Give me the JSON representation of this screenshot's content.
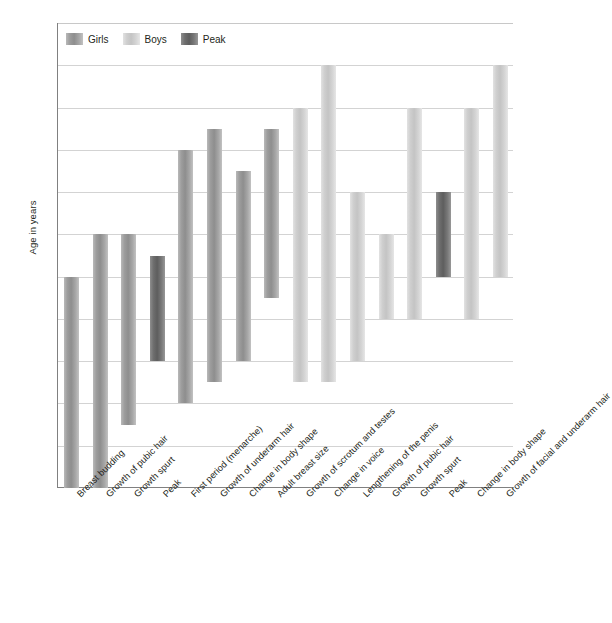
{
  "chart_data": {
    "type": "bar",
    "orientation": "vertical-range",
    "title": "",
    "xlabel": "",
    "ylabel": "Age in years",
    "ylim": [
      8,
      19
    ],
    "yticks": [
      8,
      9,
      10,
      11,
      12,
      13,
      14,
      15,
      16,
      17,
      18,
      19
    ],
    "grid": true,
    "legend_position": "top-left-inside",
    "legend": [
      {
        "name": "Girls",
        "color": "#9d9d9d"
      },
      {
        "name": "Boys",
        "color": "#cfcfcf"
      },
      {
        "name": "Peak",
        "color": "#6f6f6f"
      }
    ],
    "categories": [
      "Breast budding",
      "Growth of pubic hair",
      "Growth spurt",
      "Peak",
      "First period (menarche)",
      "Growth of underarm hair",
      "Change in body shape",
      "Adult breast size",
      "Growth of scrotum and testes",
      "Change in voice",
      "Lengthening of the penis",
      "Growth of pubic hair",
      "Growth spurt",
      "Peak",
      "Change in body shape",
      "Growth of facial and underarm hair"
    ],
    "bars": [
      {
        "label": "Breast budding",
        "series": "Girls",
        "start": 8.0,
        "end": 13.0
      },
      {
        "label": "Growth of pubic hair",
        "series": "Girls",
        "start": 8.0,
        "end": 14.0
      },
      {
        "label": "Growth spurt",
        "series": "Girls",
        "start": 9.5,
        "end": 14.0
      },
      {
        "label": "Peak",
        "series": "Peak",
        "start": 11.0,
        "end": 13.5
      },
      {
        "label": "First period (menarche)",
        "series": "Girls",
        "start": 10.0,
        "end": 16.0
      },
      {
        "label": "Growth of underarm hair",
        "series": "Girls",
        "start": 10.5,
        "end": 16.5
      },
      {
        "label": "Change in body shape",
        "series": "Girls",
        "start": 11.0,
        "end": 15.5
      },
      {
        "label": "Adult breast size",
        "series": "Girls",
        "start": 12.5,
        "end": 16.5
      },
      {
        "label": "Growth of scrotum and testes",
        "series": "Boys",
        "start": 10.5,
        "end": 17.0
      },
      {
        "label": "Change in voice",
        "series": "Boys",
        "start": 10.5,
        "end": 18.0
      },
      {
        "label": "Lengthening of the penis",
        "series": "Boys",
        "start": 11.0,
        "end": 15.0
      },
      {
        "label": "Growth of pubic hair",
        "series": "Boys",
        "start": 12.0,
        "end": 14.0
      },
      {
        "label": "Growth spurt",
        "series": "Boys",
        "start": 12.0,
        "end": 17.0
      },
      {
        "label": "Peak",
        "series": "Peak",
        "start": 13.0,
        "end": 15.0
      },
      {
        "label": "Change in body shape",
        "series": "Boys",
        "start": 12.0,
        "end": 17.0
      },
      {
        "label": "Growth of facial and underarm hair",
        "series": "Boys",
        "start": 13.0,
        "end": 18.0
      }
    ]
  }
}
